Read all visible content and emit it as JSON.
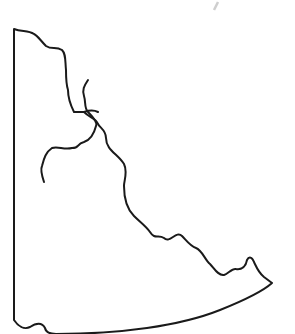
{
  "map": {
    "title": "",
    "description": "Outline map of a territory with river lines",
    "stroke_color": "#1a1a1a",
    "background": "#ffffff",
    "features": [
      {
        "name": "territory-boundary",
        "type": "outline"
      },
      {
        "name": "main-river",
        "type": "river"
      },
      {
        "name": "tributary-river",
        "type": "river"
      }
    ]
  }
}
